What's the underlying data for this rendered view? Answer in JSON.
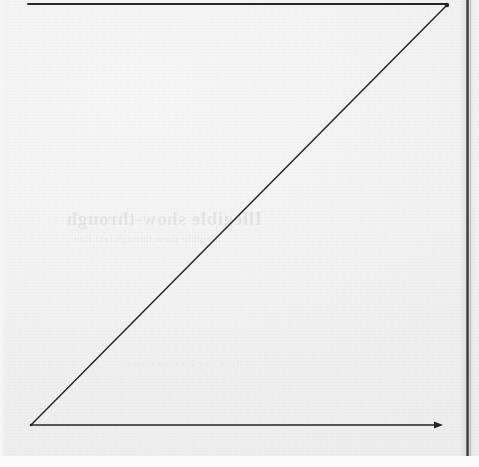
{
  "page": {
    "kind": "scanned-page-figure",
    "width": 479,
    "height": 467,
    "paper_color": "#f3f3f3",
    "ink_color": "#262626",
    "page_edge_color": "#fbfbfb"
  },
  "figure": {
    "caption": "",
    "title": "",
    "ink_color": "#262626",
    "origin_label": "",
    "elements": [
      {
        "name": "top-horizontal-line",
        "kind": "line",
        "x1": 28,
        "y1": 4,
        "x2": 447,
        "y2": 4,
        "stroke_width": 2.0
      },
      {
        "name": "diagonal-line",
        "kind": "line",
        "x1": 31,
        "y1": 425,
        "x2": 447,
        "y2": 5,
        "stroke_width": 1.5
      },
      {
        "name": "horizontal-axis",
        "kind": "line",
        "x1": 31,
        "y1": 425,
        "x2": 440,
        "y2": 425,
        "stroke_width": 1.6
      },
      {
        "name": "axis-arrowhead",
        "kind": "arrow",
        "x": 441,
        "y": 425,
        "size": 5
      },
      {
        "name": "apex-vertex",
        "kind": "vertex",
        "x": 447,
        "y": 5
      },
      {
        "name": "origin-vertex",
        "kind": "vertex",
        "x": 31,
        "y": 425
      }
    ]
  },
  "gutter": {
    "name": "binding-gutter",
    "x": 466,
    "width": 3,
    "height": 456,
    "color": "#3a3a3a"
  },
  "bleed_through": {
    "note": "mirrored show-through text from the reverse side of the sheet; illegible",
    "line_1": "Illegible show-through",
    "line_2": "illegible show through text line",
    "line_3": "faint illegible show through"
  }
}
